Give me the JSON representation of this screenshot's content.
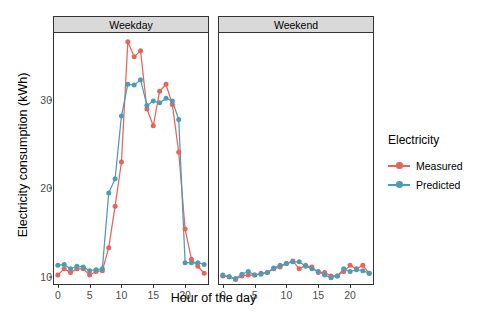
{
  "chart_data": {
    "type": "line",
    "title": "",
    "xlabel": "Hour of the day",
    "ylabel": "Electricity consumption (kWh)",
    "xlim": [
      -0.6,
      23.6
    ],
    "ylim": [
      9.3,
      37.6
    ],
    "xticks": [
      0,
      5,
      10,
      15,
      20
    ],
    "yticks": [
      10,
      20,
      30
    ],
    "grid": false,
    "legend_position": "right",
    "legend_title": "Electricity",
    "facets": [
      {
        "label": "Weekday",
        "x": [
          0,
          1,
          2,
          3,
          4,
          5,
          6,
          7,
          8,
          9,
          10,
          11,
          12,
          13,
          14,
          15,
          16,
          17,
          18,
          19,
          20,
          21,
          22,
          23
        ],
        "series": [
          {
            "name": "Measured",
            "color": "#e8635a",
            "values": [
              10.2,
              10.9,
              10.5,
              10.9,
              10.9,
              10.2,
              10.6,
              10.7,
              13.3,
              18.0,
              23.0,
              36.6,
              34.9,
              35.6,
              29.0,
              27.1,
              31.0,
              31.8,
              29.5,
              24.1,
              15.4,
              12.0,
              11.2,
              10.4
            ]
          },
          {
            "name": "Predicted",
            "color": "#4c9cb8",
            "values": [
              11.3,
              11.4,
              10.9,
              11.2,
              11.1,
              10.7,
              10.8,
              10.9,
              19.5,
              21.1,
              28.2,
              31.8,
              31.7,
              32.3,
              29.4,
              29.9,
              29.7,
              30.2,
              29.9,
              27.8,
              11.6,
              11.6,
              11.6,
              11.4
            ]
          }
        ]
      },
      {
        "label": "Weekend",
        "x": [
          0,
          1,
          2,
          3,
          4,
          5,
          6,
          7,
          8,
          9,
          10,
          11,
          12,
          13,
          14,
          15,
          16,
          17,
          18,
          19,
          20,
          21,
          22,
          23
        ],
        "series": [
          {
            "name": "Measured",
            "color": "#e8635a",
            "values": [
              10.1,
              10.0,
              9.7,
              10.1,
              10.2,
              10.2,
              10.4,
              10.5,
              10.9,
              11.1,
              11.5,
              11.8,
              10.9,
              11.3,
              11.1,
              10.5,
              10.5,
              10.1,
              10.1,
              10.6,
              11.3,
              10.9,
              11.3,
              10.4
            ]
          },
          {
            "name": "Predicted",
            "color": "#4c9cb8",
            "values": [
              10.2,
              10.0,
              9.8,
              10.3,
              10.6,
              10.2,
              10.3,
              10.5,
              11.0,
              11.3,
              11.5,
              11.7,
              11.7,
              11.2,
              10.9,
              10.6,
              10.2,
              9.9,
              10.1,
              10.9,
              10.6,
              10.8,
              10.7,
              10.4
            ]
          }
        ]
      }
    ]
  },
  "legend": {
    "title": "Electricity",
    "items": [
      {
        "label": "Measured",
        "color": "#e8635a"
      },
      {
        "label": "Predicted",
        "color": "#4c9cb8"
      }
    ]
  },
  "axes": {
    "y_title": "Electricity consumption (kWh)",
    "x_title": "Hour of the day",
    "y_tick_labels": [
      "30",
      "20",
      "10"
    ],
    "x_tick_labels": [
      "0",
      "5",
      "10",
      "15",
      "20"
    ]
  },
  "panels": [
    {
      "strip_label": "Weekday"
    },
    {
      "strip_label": "Weekend"
    }
  ],
  "colors": {
    "measured": "#e8635a",
    "predicted": "#4c9cb8",
    "strip_background": "#d9d9d9",
    "panel_border": "#333333",
    "tick_text": "#4d4d4d"
  }
}
